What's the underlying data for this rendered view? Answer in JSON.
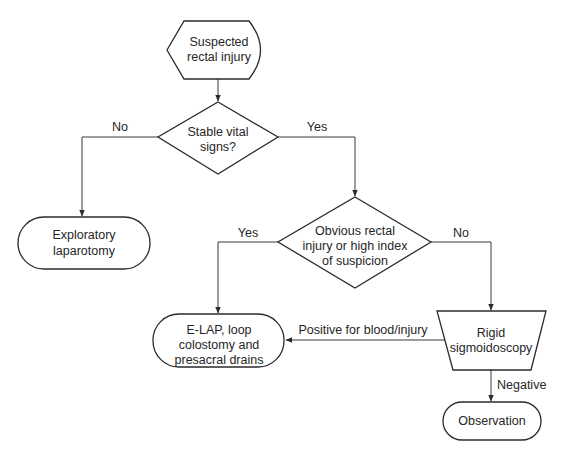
{
  "diagram": {
    "type": "flowchart",
    "nodes": {
      "start": {
        "shape": "display",
        "lines": [
          "Suspected",
          "rectal injury"
        ]
      },
      "vitals": {
        "shape": "decision",
        "lines": [
          "Stable vital",
          "signs?"
        ]
      },
      "exlap": {
        "shape": "terminator",
        "lines": [
          "Exploratory",
          "laparotomy"
        ]
      },
      "suspicion": {
        "shape": "decision",
        "lines": [
          "Obvious rectal",
          "injury or high index",
          "of suspicion"
        ]
      },
      "elap": {
        "shape": "terminator",
        "lines": [
          "E-LAP, loop",
          "colostomy and",
          "presacral drains"
        ]
      },
      "sigmoid": {
        "shape": "manual-operation",
        "lines": [
          "Rigid",
          "sigmoidoscopy"
        ]
      },
      "observation": {
        "shape": "terminator",
        "lines": [
          "Observation"
        ]
      }
    },
    "edges": [
      {
        "from": "start",
        "to": "vitals",
        "label": ""
      },
      {
        "from": "vitals",
        "to": "exlap",
        "label": "No"
      },
      {
        "from": "vitals",
        "to": "suspicion",
        "label": "Yes"
      },
      {
        "from": "suspicion",
        "to": "elap",
        "label": "Yes"
      },
      {
        "from": "suspicion",
        "to": "sigmoid",
        "label": "No"
      },
      {
        "from": "sigmoid",
        "to": "elap",
        "label": "Positive for blood/injury"
      },
      {
        "from": "sigmoid",
        "to": "observation",
        "label": "Negative"
      }
    ],
    "labels": {
      "vitals_no": "No",
      "vitals_yes": "Yes",
      "suspicion_yes": "Yes",
      "suspicion_no": "No",
      "sigmoid_positive": "Positive for blood/injury",
      "sigmoid_negative": "Negative"
    }
  }
}
